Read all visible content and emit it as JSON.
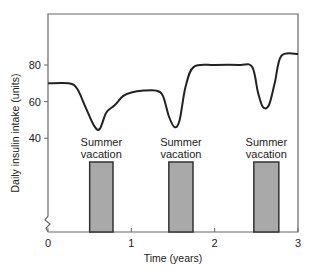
{
  "chart_data": {
    "type": "line",
    "title": "",
    "xlabel": "Time (years)",
    "ylabel": "Daily insulin intake (units)",
    "xlim": [
      0,
      3
    ],
    "ylim_visible": [
      40,
      100
    ],
    "y_axis_break": true,
    "grid": false,
    "legend": null,
    "x_ticks": [
      0,
      1,
      2,
      3
    ],
    "y_ticks": [
      40,
      60,
      80
    ],
    "series": [
      {
        "name": "Daily insulin intake",
        "x": [
          0,
          0.25,
          0.35,
          0.45,
          0.55,
          0.62,
          0.7,
          0.8,
          0.9,
          1.0,
          1.15,
          1.3,
          1.38,
          1.45,
          1.52,
          1.58,
          1.65,
          1.75,
          2.0,
          2.3,
          2.45,
          2.52,
          2.58,
          2.65,
          2.72,
          2.8,
          3.0
        ],
        "values": [
          70,
          70,
          67,
          57,
          47,
          45,
          54,
          58,
          63,
          65,
          66,
          66,
          63,
          52,
          46,
          50,
          68,
          79,
          80,
          80,
          79,
          65,
          57,
          58,
          70,
          85,
          86
        ]
      }
    ],
    "annotations": [
      {
        "label_line1": "Summer",
        "label_line2": "vacation",
        "x_start": 0.5,
        "x_end": 0.78
      },
      {
        "label_line1": "Summer",
        "label_line2": "vacation",
        "x_start": 1.45,
        "x_end": 1.74
      },
      {
        "label_line1": "Summer",
        "label_line2": "vacation",
        "x_start": 2.47,
        "x_end": 2.77
      }
    ]
  },
  "style": {
    "line_color": "#222222",
    "axis_color": "#666666",
    "bar_fill": "#a9a9a9",
    "bar_stroke": "#333333"
  }
}
